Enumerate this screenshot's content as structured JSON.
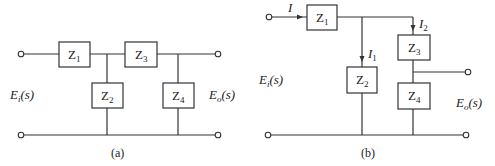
{
  "figure_a": {
    "caption": "(a)",
    "input_label": "E",
    "input_sub": "i",
    "input_arg": "(s)",
    "output_label": "E",
    "output_sub": "o",
    "output_arg": "(s)",
    "impedances": [
      {
        "name": "Z",
        "sub": "1"
      },
      {
        "name": "Z",
        "sub": "2"
      },
      {
        "name": "Z",
        "sub": "3"
      },
      {
        "name": "Z",
        "sub": "4"
      }
    ]
  },
  "figure_b": {
    "caption": "(b)",
    "input_label": "E",
    "input_sub": "i",
    "input_arg": "(s)",
    "output_label": "E",
    "output_sub": "o",
    "output_arg": "(s)",
    "currents": [
      {
        "name": "I",
        "sub": ""
      },
      {
        "name": "I",
        "sub": "1"
      },
      {
        "name": "I",
        "sub": "2"
      }
    ],
    "impedances": [
      {
        "name": "Z",
        "sub": "1"
      },
      {
        "name": "Z",
        "sub": "2"
      },
      {
        "name": "Z",
        "sub": "3"
      },
      {
        "name": "Z",
        "sub": "4"
      }
    ]
  },
  "colors": {
    "line": "#333333",
    "background": "#ffffff"
  }
}
